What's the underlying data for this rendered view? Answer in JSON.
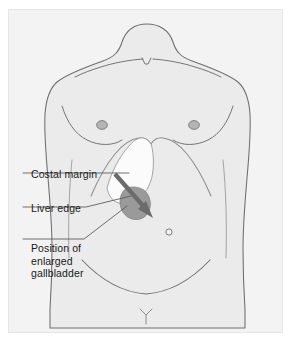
{
  "figure": {
    "panel_background": "#f3f3f3",
    "page_background": "#ffffff",
    "caption": ""
  },
  "labels": [
    {
      "id": "costal-margin",
      "text": "Costal margin",
      "lines": [
        "Costal margin"
      ]
    },
    {
      "id": "liver-edge",
      "text": "Liver edge",
      "lines": [
        "Liver edge"
      ]
    },
    {
      "id": "enlarged-gallbladder",
      "text": "Position of enlarged gallbladder",
      "lines": [
        "Position of",
        "enlarged",
        "gallbladder"
      ]
    }
  ],
  "anatomy": {
    "body_outline": "male anterior torso, shoulders to groin",
    "features": [
      "clavicles",
      "sternal notch",
      "left nipple",
      "right nipple",
      "costal margin",
      "liver",
      "gallbladder",
      "umbilicus",
      "inguinal creases",
      "pubic symphysis"
    ],
    "colors": {
      "skin_fill": "#ebebeb",
      "outline": "#6e6e6e",
      "nipple_fill": "#b3b3b3",
      "liver_fill": "#fbfbfb",
      "gallbladder_fill": "#9a9a9a",
      "arrow": "#6b6b6b",
      "leader_line": "#555555"
    },
    "arrow": {
      "name": "gallbladder-direction-arrow",
      "description": "arrow pointing down and right from costal margin toward enlarged gallbladder position"
    }
  }
}
